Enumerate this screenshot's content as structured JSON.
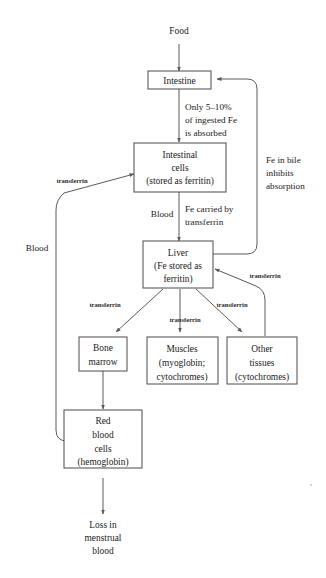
{
  "diagram": {
    "colors": {
      "background": "#ffffff",
      "box_stroke": "#4a4a4a",
      "connector": "#5a5a5a",
      "text": "#1a1a1a"
    },
    "nodes": {
      "food": {
        "label": "Food",
        "boxed": false
      },
      "intestine": {
        "label": "Intestine",
        "boxed": true
      },
      "intestinal_cells": {
        "boxed": true,
        "lines": [
          "Intestinal",
          "cells",
          "(stored as ferritin)"
        ]
      },
      "liver": {
        "boxed": true,
        "lines": [
          "Liver",
          "(Fe stored as",
          "ferritin)"
        ]
      },
      "bone_marrow": {
        "boxed": true,
        "lines": [
          "Bone",
          "marrow"
        ]
      },
      "muscles": {
        "boxed": true,
        "lines": [
          "Muscles",
          "(myoglobin;",
          "cytochromes)"
        ]
      },
      "other_tissues": {
        "boxed": true,
        "lines": [
          "Other",
          "tissues",
          "(cytochromes)"
        ]
      },
      "red_blood_cells": {
        "boxed": true,
        "lines": [
          "Red",
          "blood",
          "cells",
          "(hemoglobin)"
        ]
      },
      "loss": {
        "boxed": false,
        "lines": [
          "Loss in",
          "menstrual",
          "blood"
        ]
      }
    },
    "edge_labels": {
      "absorption_note": {
        "lines": [
          "Only 5–10%",
          "of ingested Fe",
          "is absorbed"
        ]
      },
      "bile_note": {
        "lines": [
          "Fe in bile",
          "inhibits",
          "absorption"
        ]
      },
      "carried_note": {
        "lines": [
          "Fe carried by",
          "transferrin"
        ]
      },
      "blood_to_liver": "Blood",
      "blood_left": "Blood",
      "transferrin_left": "transferrin",
      "transferrin_bone": "transferrin",
      "transferrin_muscles": "transferrin",
      "transferrin_other": "transferrin",
      "transferrin_return": "transferrin"
    }
  }
}
